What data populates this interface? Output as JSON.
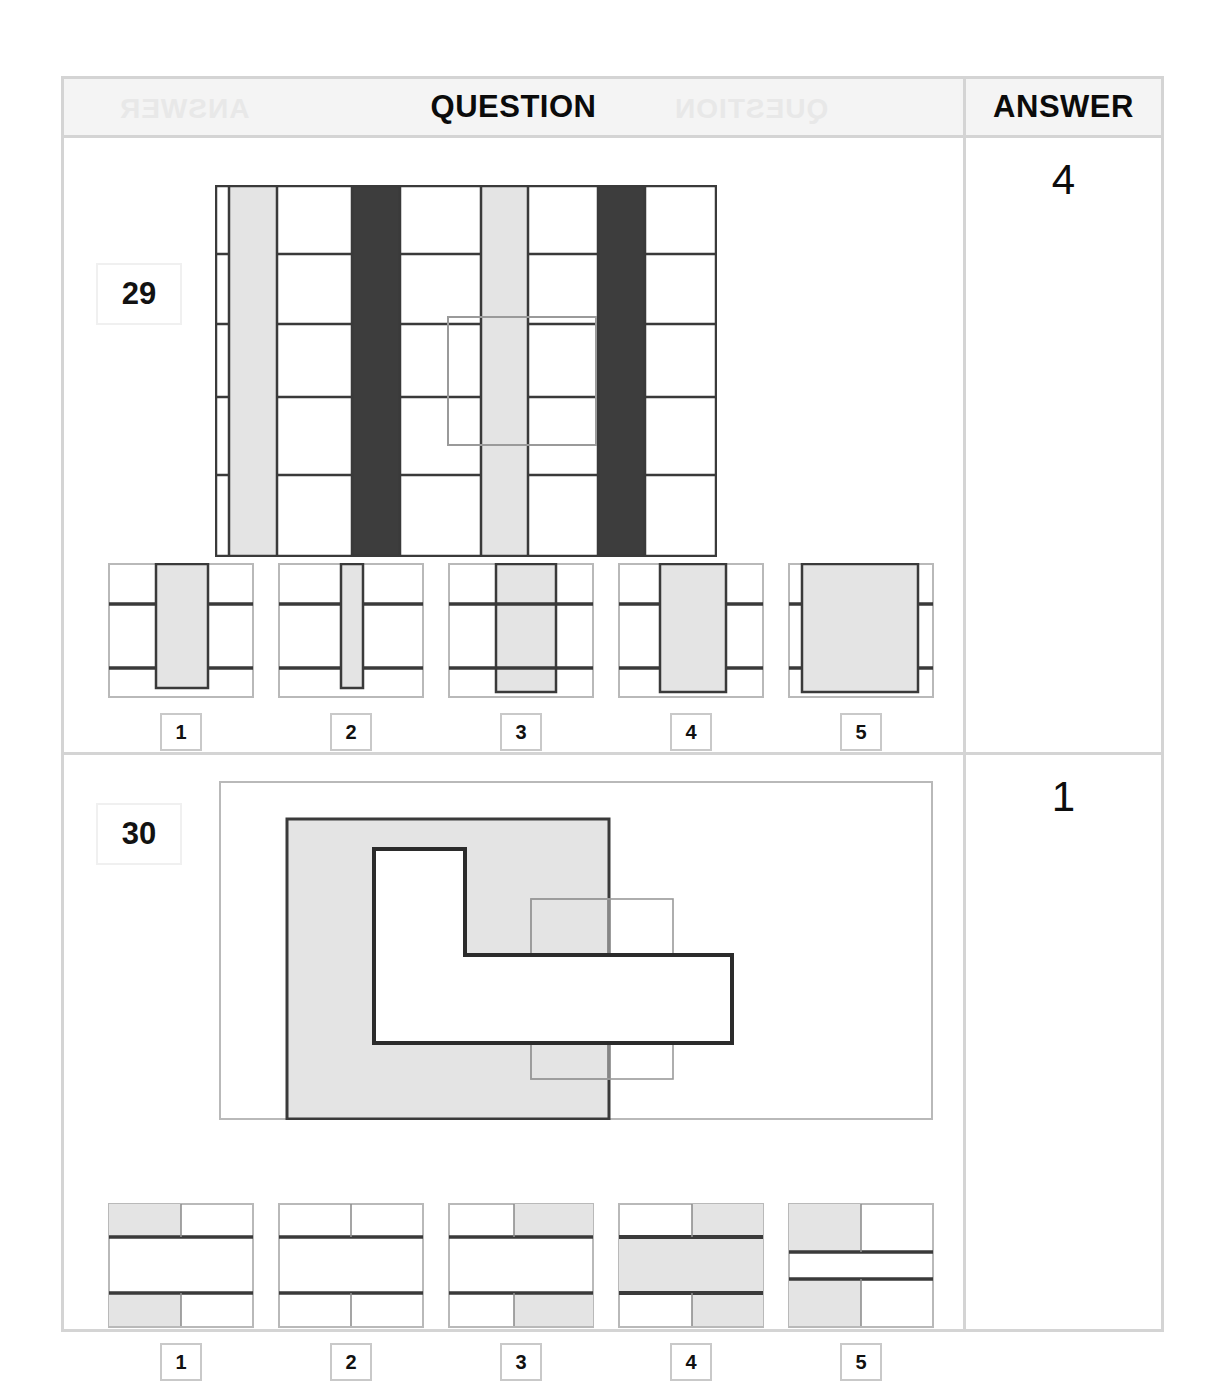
{
  "page": {
    "width": 1225,
    "height": 1399,
    "background": "#ffffff"
  },
  "colors": {
    "light_gray_fill": "#e2e2e2",
    "dark_gray_fill": "#3d3d3d",
    "heavy_line": "#3a3a3a",
    "light_line": "#b9b9b9",
    "table_border": "#d4d4d4",
    "header_band": "#f4f4f4",
    "text": "#0b0b0b"
  },
  "header": {
    "question_label": "QUESTION",
    "answer_label": "ANSWER",
    "ghost_left": "ANSWER",
    "ghost_right": "QUESTION"
  },
  "questions": [
    {
      "number": "29",
      "answer": "4",
      "type": "embedded-figure",
      "stimulus": {
        "description": "Striped vertical-column grid with a hidden rectangle outline overlay",
        "columns": [
          {
            "x": 0,
            "w": 14,
            "fill": "white"
          },
          {
            "x": 14,
            "w": 48,
            "fill": "light_gray"
          },
          {
            "x": 62,
            "w": 75,
            "fill": "white"
          },
          {
            "x": 137,
            "w": 48,
            "fill": "dark_gray"
          },
          {
            "x": 185,
            "w": 81,
            "fill": "white"
          },
          {
            "x": 266,
            "w": 47,
            "fill": "light_gray"
          },
          {
            "x": 313,
            "w": 70,
            "fill": "white"
          },
          {
            "x": 383,
            "w": 47,
            "fill": "dark_gray"
          },
          {
            "x": 430,
            "w": 70,
            "fill": "white"
          }
        ],
        "row_lines_y": [
          69,
          139,
          212,
          290
        ],
        "overlay_rect": {
          "x": 233,
          "y": 132,
          "w": 148,
          "h": 128
        }
      },
      "options": [
        {
          "label": "1",
          "bars": [
            {
              "x": 33,
              "w": 36
            }
          ],
          "variant": "narrow-center"
        },
        {
          "label": "2",
          "bars": [
            {
              "x": 46,
              "w": 16
            }
          ],
          "variant": "very-narrow-center"
        },
        {
          "label": "3",
          "bars": [
            {
              "x": 33,
              "w": 44
            }
          ],
          "variant": "center"
        },
        {
          "label": "4",
          "bars": [
            {
              "x": 29,
              "w": 48
            }
          ],
          "variant": "wide-center"
        },
        {
          "label": "5",
          "bars": [
            {
              "x": 10,
              "w": 84
            }
          ],
          "variant": "very-wide"
        }
      ]
    },
    {
      "number": "30",
      "answer": "1",
      "type": "embedded-figure",
      "stimulus": {
        "description": "Large gray square with an L-shaped white notch, overlaid by two thin outline rectangles to the right",
        "outer_frame": {
          "x": 0,
          "y": 0,
          "w": 712,
          "h": 337
        },
        "gray_square": {
          "x": 68,
          "y": 38,
          "w": 322,
          "h": 300
        },
        "l_shape": {
          "x": 155,
          "y": 68,
          "w": 160,
          "h": 178
        },
        "thin_rect_a": {
          "x": 312,
          "y": 118,
          "w": 78,
          "h": 180
        },
        "thin_rect_b": {
          "x": 312,
          "y": 118,
          "w": 142,
          "h": 180
        },
        "bold_rect": {
          "x": 233,
          "y": 174,
          "w": 280,
          "h": 88
        }
      },
      "options": [
        {
          "label": "1",
          "cells": {
            "top_left": "gray",
            "top_right": "white",
            "middle": "white",
            "bottom_left": "gray",
            "bottom_right": "white"
          },
          "layout": "thin-mid"
        },
        {
          "label": "2",
          "cells": {
            "top_left": "white",
            "top_right": "white",
            "middle": "white",
            "bottom_left": "white",
            "bottom_right": "white"
          },
          "layout": "thin-mid"
        },
        {
          "label": "3",
          "cells": {
            "top_left": "white",
            "top_right": "gray",
            "middle": "white",
            "bottom_left": "white",
            "bottom_right": "gray"
          },
          "layout": "thin-mid"
        },
        {
          "label": "4",
          "cells": {
            "top_left": "white",
            "top_right": "gray",
            "middle": "gray",
            "bottom_left": "white",
            "bottom_right": "gray"
          },
          "layout": "thin-mid"
        },
        {
          "label": "5",
          "cells": {
            "top_left": "gray",
            "top_right": "white",
            "middle": "white",
            "bottom_left": "gray",
            "bottom_right": "white"
          },
          "layout": "tall-rows"
        }
      ]
    }
  ]
}
